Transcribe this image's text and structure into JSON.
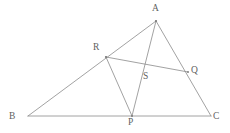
{
  "figure": {
    "background_color": "#ffffff",
    "line_color": "#8a8a8a",
    "label_color": "#5f5f5f",
    "width": 230,
    "height": 133
  },
  "points": {
    "A": {
      "label": "A",
      "x": 156,
      "y": 21,
      "label_x": 152,
      "label_y": 4
    },
    "B": {
      "label": "B",
      "x": 28,
      "y": 116,
      "label_x": 9,
      "label_y": 112
    },
    "C": {
      "label": "C",
      "x": 211,
      "y": 116,
      "label_x": 213,
      "label_y": 112
    },
    "P": {
      "label": "P",
      "x": 132,
      "y": 116,
      "label_x": 128,
      "label_y": 118
    },
    "Q": {
      "label": "Q",
      "x": 188,
      "y": 72,
      "label_x": 191,
      "label_y": 66
    },
    "R": {
      "label": "R",
      "x": 106,
      "y": 57,
      "label_x": 93,
      "label_y": 43
    },
    "S": {
      "label": "S",
      "x": 141,
      "y": 71,
      "label_x": 143,
      "label_y": 72
    }
  },
  "segments": [
    {
      "name": "side-AB",
      "from": "A",
      "to": "B"
    },
    {
      "name": "side-BC",
      "from": "B",
      "to": "C"
    },
    {
      "name": "side-CA",
      "from": "C",
      "to": "A"
    },
    {
      "name": "cevian-AP",
      "from": "A",
      "to": "P"
    },
    {
      "name": "cevian-RP",
      "from": "R",
      "to": "P"
    },
    {
      "name": "segment-RQ",
      "from": "R",
      "to": "Q"
    }
  ]
}
